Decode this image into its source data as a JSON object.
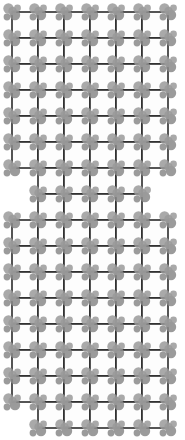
{
  "canvas": {
    "width": 185,
    "height": 440,
    "background_color": "#ffffff",
    "description": "Monochrome lattice pattern of square cells with gray blob clusters at grid intersections"
  },
  "pattern": {
    "name": "square-lattice-with-blob-motif",
    "cell_size": 26,
    "origin_x": 12,
    "origin_y": 12,
    "line_color": "#2b2b2b",
    "line_width": 1.6,
    "cell_fill": "#fdfdfd",
    "blob_color": "#9a9a9a",
    "blob_color_dark": "#8a8a8a",
    "blob_opacity": 0.85,
    "blob_radius_large": 5.2,
    "blob_radius_small": 3.4,
    "silhouette": "hourglass",
    "columns": 6,
    "rows_total": 16,
    "blob_cluster_offsets": [
      {
        "dx": -3.5,
        "dy": -3.5,
        "r": 5.2
      },
      {
        "dx": 3.0,
        "dy": 3.0,
        "r": 5.2
      },
      {
        "dx": 5.5,
        "dy": -4.0,
        "r": 3.4
      },
      {
        "dx": -5.0,
        "dy": 5.0,
        "r": 3.4
      },
      {
        "dx": 0.5,
        "dy": -1.0,
        "r": 4.2
      }
    ],
    "row_spans": [
      {
        "row": 0,
        "y": 12,
        "col_start": 0,
        "col_count": 6
      },
      {
        "row": 1,
        "y": 38,
        "col_start": 0,
        "col_count": 6
      },
      {
        "row": 2,
        "y": 64,
        "col_start": 0,
        "col_count": 6
      },
      {
        "row": 3,
        "y": 90,
        "col_start": 0,
        "col_count": 6
      },
      {
        "row": 4,
        "y": 116,
        "col_start": 0,
        "col_count": 6
      },
      {
        "row": 5,
        "y": 142,
        "col_start": 0,
        "col_count": 6
      },
      {
        "row": 6,
        "y": 168,
        "col_start": 1,
        "col_count": 4
      },
      {
        "row": 7,
        "y": 194,
        "col_start": 1,
        "col_count": 4
      },
      {
        "row": 8,
        "y": 220,
        "col_start": 0,
        "col_count": 6
      },
      {
        "row": 9,
        "y": 246,
        "col_start": 0,
        "col_count": 6
      },
      {
        "row": 10,
        "y": 272,
        "col_start": 0,
        "col_count": 6
      },
      {
        "row": 11,
        "y": 298,
        "col_start": 0,
        "col_count": 6
      },
      {
        "row": 12,
        "y": 324,
        "col_start": 0,
        "col_count": 6
      },
      {
        "row": 13,
        "y": 350,
        "col_start": 0,
        "col_count": 6
      },
      {
        "row": 14,
        "y": 376,
        "col_start": 0,
        "col_count": 6
      },
      {
        "row": 15,
        "y": 402,
        "col_start": 1,
        "col_count": 5
      }
    ]
  }
}
